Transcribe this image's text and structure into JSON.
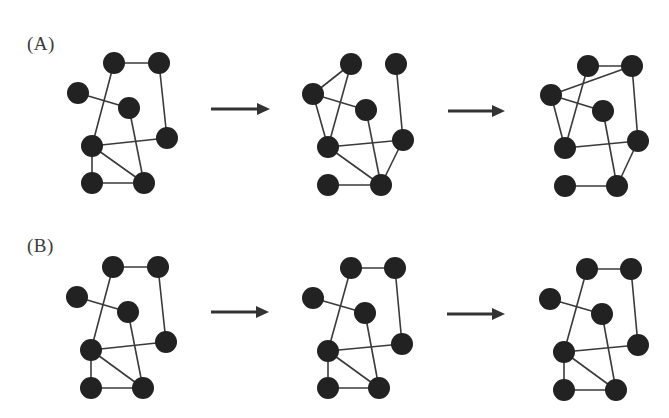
{
  "figure": {
    "node_color": "#222222",
    "edge_color": "#3a3a3a",
    "arrow_color": "#333333",
    "node_radius": 11,
    "rows": [
      {
        "label": "(A)",
        "label_pos": [
          27,
          33
        ],
        "graphs": [
          {
            "nodes": [
              [
                114,
                63
              ],
              [
                159,
                63
              ],
              [
                78,
                93
              ],
              [
                129,
                108
              ],
              [
                167,
                138
              ],
              [
                92,
                146
              ],
              [
                92,
                183
              ],
              [
                144,
                183
              ]
            ],
            "edges": [
              [
                0,
                1
              ],
              [
                0,
                5
              ],
              [
                1,
                4
              ],
              [
                2,
                3
              ],
              [
                3,
                7
              ],
              [
                5,
                4
              ],
              [
                5,
                6
              ],
              [
                5,
                7
              ],
              [
                6,
                7
              ]
            ]
          },
          {
            "nodes": [
              [
                351,
                64
              ],
              [
                396,
                64
              ],
              [
                313,
                94
              ],
              [
                366,
                110
              ],
              [
                403,
                140
              ],
              [
                328,
                147
              ],
              [
                328,
                185
              ],
              [
                381,
                185
              ]
            ],
            "edges": [
              [
                0,
                2
              ],
              [
                0,
                5
              ],
              [
                2,
                3
              ],
              [
                2,
                5
              ],
              [
                1,
                4
              ],
              [
                3,
                7
              ],
              [
                5,
                4
              ],
              [
                5,
                7
              ],
              [
                6,
                7
              ],
              [
                4,
                7
              ]
            ]
          },
          {
            "nodes": [
              [
                588,
                66
              ],
              [
                632,
                66
              ],
              [
                551,
                95
              ],
              [
                603,
                111
              ],
              [
                638,
                141
              ],
              [
                565,
                148
              ],
              [
                565,
                186
              ],
              [
                617,
                186
              ]
            ],
            "edges": [
              [
                0,
                1
              ],
              [
                1,
                2
              ],
              [
                0,
                5
              ],
              [
                2,
                3
              ],
              [
                2,
                5
              ],
              [
                1,
                4
              ],
              [
                3,
                7
              ],
              [
                5,
                4
              ],
              [
                6,
                7
              ],
              [
                4,
                7
              ]
            ]
          }
        ],
        "arrows": [
          {
            "x1": 211,
            "x2": 270,
            "y": 109
          },
          {
            "x1": 448,
            "x2": 505,
            "y": 111
          }
        ]
      },
      {
        "label": "(B)",
        "label_pos": [
          27,
          235
        ],
        "graphs": [
          {
            "nodes": [
              [
                113,
                267
              ],
              [
                158,
                267
              ],
              [
                77,
                297
              ],
              [
                128,
                312
              ],
              [
                166,
                342
              ],
              [
                91,
                350
              ],
              [
                91,
                388
              ],
              [
                143,
                388
              ]
            ],
            "edges": [
              [
                0,
                1
              ],
              [
                0,
                5
              ],
              [
                1,
                4
              ],
              [
                2,
                3
              ],
              [
                3,
                7
              ],
              [
                5,
                4
              ],
              [
                5,
                6
              ],
              [
                5,
                7
              ],
              [
                6,
                7
              ]
            ]
          },
          {
            "nodes": [
              [
                351,
                268
              ],
              [
                395,
                268
              ],
              [
                313,
                298
              ],
              [
                365,
                313
              ],
              [
                402,
                344
              ],
              [
                328,
                351
              ],
              [
                328,
                388
              ],
              [
                379,
                388
              ]
            ],
            "edges": [
              [
                0,
                1
              ],
              [
                0,
                5
              ],
              [
                1,
                4
              ],
              [
                2,
                3
              ],
              [
                3,
                7
              ],
              [
                5,
                4
              ],
              [
                5,
                6
              ],
              [
                5,
                7
              ],
              [
                6,
                7
              ]
            ]
          },
          {
            "nodes": [
              [
                587,
                269
              ],
              [
                631,
                269
              ],
              [
                550,
                299
              ],
              [
                602,
                314
              ],
              [
                638,
                345
              ],
              [
                564,
                352
              ],
              [
                564,
                390
              ],
              [
                616,
                390
              ]
            ],
            "edges": [
              [
                0,
                1
              ],
              [
                0,
                5
              ],
              [
                1,
                4
              ],
              [
                2,
                3
              ],
              [
                3,
                7
              ],
              [
                5,
                4
              ],
              [
                5,
                6
              ],
              [
                5,
                7
              ],
              [
                6,
                7
              ]
            ]
          }
        ],
        "arrows": [
          {
            "x1": 211,
            "x2": 269,
            "y": 312
          },
          {
            "x1": 447,
            "x2": 505,
            "y": 314
          }
        ]
      }
    ]
  }
}
